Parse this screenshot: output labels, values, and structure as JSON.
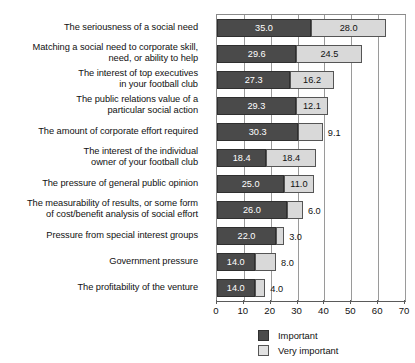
{
  "chart_data": {
    "type": "bar",
    "orientation": "horizontal",
    "stacked": true,
    "title": "",
    "xlabel": "",
    "ylabel": "",
    "xlim": [
      0,
      70
    ],
    "xticks": [
      0,
      10,
      20,
      30,
      40,
      50,
      60,
      70
    ],
    "grid": true,
    "legend_position": "bottom",
    "categories": [
      "The seriousness of a social need",
      "Matching a social need to corporate skill, need, or ability to help",
      "The interest of top executives in your football club",
      "The public relations value of a particular social action",
      "The amount of corporate effort required",
      "The interest of the individual owner of your football club",
      "The pressure of general public opinion",
      "The measurability of results, or some form of cost/benefit analysis of social effort",
      "Pressure from special interest groups",
      "Government pressure",
      "The profitability of the venture"
    ],
    "series": [
      {
        "name": "Important",
        "color": "#4a4a4a",
        "values": [
          35.0,
          29.6,
          27.3,
          29.3,
          30.3,
          18.4,
          25.0,
          26.0,
          22.0,
          14.0,
          14.0
        ]
      },
      {
        "name": "Very important",
        "color": "#d9d9d9",
        "values": [
          28.0,
          24.5,
          16.2,
          12.1,
          9.1,
          18.4,
          11.0,
          6.0,
          3.0,
          8.0,
          4.0
        ]
      }
    ],
    "data_labels": {
      "important": [
        "35.0",
        "29.6",
        "27.3",
        "29.3",
        "30.3",
        "18.4",
        "25.0",
        "26.0",
        "22.0",
        "14.0",
        "14.0"
      ],
      "very_important": [
        "28.0",
        "24.5",
        "16.2",
        "12.1",
        "9.1",
        "18.4",
        "11.0",
        "6.0",
        "3.0",
        "8.0",
        "4.0"
      ]
    }
  },
  "categories_display": [
    {
      "lines": [
        "The seriousness of a social need"
      ]
    },
    {
      "lines": [
        "Matching a social need to corporate skill,",
        "need, or ability to help"
      ]
    },
    {
      "lines": [
        "The interest of top executives",
        "in your football club"
      ]
    },
    {
      "lines": [
        "The public relations value of a",
        "particular social action"
      ]
    },
    {
      "lines": [
        "The amount of corporate effort required"
      ]
    },
    {
      "lines": [
        "The interest of the individual",
        "owner of your football club"
      ]
    },
    {
      "lines": [
        "The pressure of general public opinion"
      ]
    },
    {
      "lines": [
        "The measurability of results, or some form",
        "of cost/benefit analysis of social effort"
      ]
    },
    {
      "lines": [
        "Pressure from special interest groups"
      ]
    },
    {
      "lines": [
        "Government pressure"
      ]
    },
    {
      "lines": [
        "The profitability of the venture"
      ]
    }
  ],
  "axis": {
    "ticks": [
      "0",
      "10",
      "20",
      "30",
      "40",
      "50",
      "60",
      "70"
    ]
  },
  "legend": {
    "items": [
      {
        "label": "Important",
        "swatch": "important"
      },
      {
        "label": "Very important",
        "swatch": "very"
      }
    ]
  }
}
